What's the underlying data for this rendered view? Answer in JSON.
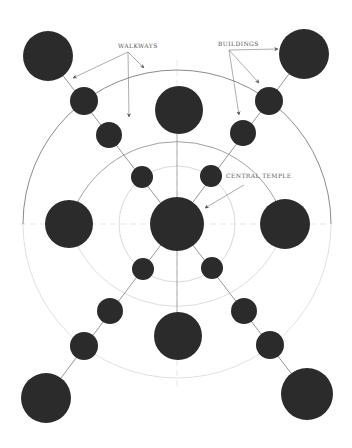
{
  "diagram": {
    "colors": {
      "background": "#ffffff",
      "building_fill": "#2b2b2b",
      "walkway_stroke": "#8a8a8a",
      "ring_stroke": "#9a9a9a",
      "ring_faint_stroke": "#c8c8c8",
      "axis_stroke": "#d6d6d6",
      "label_color": "#555555",
      "arrow_color": "#777777"
    },
    "center": {
      "x": 177,
      "y": 224
    },
    "rings": [
      {
        "name": "inner-ring",
        "r": 58
      },
      {
        "name": "middle-ring",
        "r": 112
      },
      {
        "name": "outer-ring",
        "r": 154
      }
    ],
    "labels": {
      "walkways": "WALKWAYS",
      "buildings": "BUILDINGS",
      "central_temple": "CENTRAL TEMPLE"
    },
    "buildings": [
      {
        "name": "central-temple",
        "x": 177,
        "y": 224,
        "r": 27
      },
      {
        "name": "building-north",
        "x": 179,
        "y": 110,
        "r": 24
      },
      {
        "name": "building-south",
        "x": 178,
        "y": 336,
        "r": 24
      },
      {
        "name": "building-west",
        "x": 69,
        "y": 224,
        "r": 24
      },
      {
        "name": "building-east",
        "x": 285,
        "y": 224,
        "r": 25
      },
      {
        "name": "building-corner-nw",
        "x": 48,
        "y": 56,
        "r": 25
      },
      {
        "name": "building-corner-ne",
        "x": 304,
        "y": 54,
        "r": 25
      },
      {
        "name": "building-corner-sw",
        "x": 46,
        "y": 398,
        "r": 25
      },
      {
        "name": "building-corner-se",
        "x": 307,
        "y": 394,
        "r": 26
      },
      {
        "name": "node-nw-outer",
        "x": 84,
        "y": 101,
        "r": 14
      },
      {
        "name": "node-nw-middle",
        "x": 109,
        "y": 135,
        "r": 13
      },
      {
        "name": "node-nw-inner",
        "x": 142,
        "y": 177,
        "r": 11
      },
      {
        "name": "node-ne-outer",
        "x": 269,
        "y": 101,
        "r": 14
      },
      {
        "name": "node-ne-middle",
        "x": 243,
        "y": 133,
        "r": 13
      },
      {
        "name": "node-ne-inner",
        "x": 211,
        "y": 176,
        "r": 11
      },
      {
        "name": "node-sw-inner",
        "x": 143,
        "y": 269,
        "r": 11
      },
      {
        "name": "node-sw-middle",
        "x": 110,
        "y": 311,
        "r": 13
      },
      {
        "name": "node-sw-outer",
        "x": 84,
        "y": 346,
        "r": 14
      },
      {
        "name": "node-se-inner",
        "x": 212,
        "y": 268,
        "r": 11
      },
      {
        "name": "node-se-middle",
        "x": 244,
        "y": 311,
        "r": 13
      },
      {
        "name": "node-se-outer",
        "x": 270,
        "y": 345,
        "r": 14
      }
    ]
  }
}
